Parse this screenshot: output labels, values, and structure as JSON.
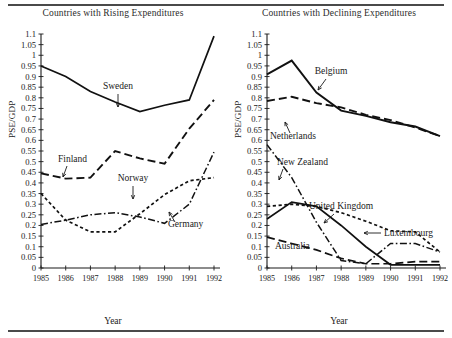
{
  "figure": {
    "ylabel": "PSE/GDP",
    "xlabel": "Year",
    "years": [
      1985,
      1986,
      1987,
      1988,
      1989,
      1990,
      1991,
      1992
    ],
    "ytick_labels": [
      "0",
      "0.05",
      "0.1",
      "0.15",
      "0.2",
      "0.25",
      "0.3",
      "0.35",
      "0.4",
      "0.45",
      "0.5",
      "0.55",
      "0.6",
      "0.65",
      "0.7",
      "0.75",
      "0.8",
      "0.85",
      "0.9",
      "0.95",
      "1",
      "1.05",
      "1.1"
    ],
    "ytick_values": [
      0,
      0.05,
      0.1,
      0.15,
      0.2,
      0.25,
      0.3,
      0.35,
      0.4,
      0.45,
      0.5,
      0.55,
      0.6,
      0.65,
      0.7,
      0.75,
      0.8,
      0.85,
      0.9,
      0.95,
      1.0,
      1.05,
      1.1
    ],
    "ylim": [
      0,
      1.1
    ],
    "xlim": [
      1985,
      1992
    ],
    "line_color": "#111111"
  },
  "chart_data": [
    {
      "type": "line",
      "title": "Countries with Rising Expenditures",
      "xlabel": "Year",
      "ylabel": "PSE/GDP",
      "x": [
        1985,
        1986,
        1987,
        1988,
        1989,
        1990,
        1991,
        1992
      ],
      "xlim": [
        1985,
        1992
      ],
      "ylim": [
        0,
        1.1
      ],
      "grid": false,
      "legend": "inline-annotations",
      "series": [
        {
          "name": "Sweden",
          "style": "solid",
          "values": [
            0.95,
            0.9,
            0.83,
            0.78,
            0.735,
            0.765,
            0.79,
            1.09
          ]
        },
        {
          "name": "Finland",
          "style": "long-dash",
          "values": [
            0.445,
            0.42,
            0.425,
            0.55,
            0.515,
            0.49,
            0.655,
            0.79
          ]
        },
        {
          "name": "Norway",
          "style": "short-dash",
          "values": [
            0.35,
            0.225,
            0.17,
            0.17,
            0.255,
            0.345,
            0.41,
            0.425
          ]
        },
        {
          "name": "Germany",
          "style": "dash-dot",
          "values": [
            0.205,
            0.225,
            0.25,
            0.26,
            0.24,
            0.21,
            0.3,
            0.545
          ]
        }
      ],
      "annotations": [
        {
          "label": "Sweden",
          "points_to": "Sweden"
        },
        {
          "label": "Finland",
          "points_to": "Finland"
        },
        {
          "label": "Norway",
          "points_to": "Norway"
        },
        {
          "label": "Germany",
          "points_to": "Germany"
        }
      ]
    },
    {
      "type": "line",
      "title": "Countries with Declining Expenditures",
      "xlabel": "Year",
      "ylabel": "PSE/GDP",
      "x": [
        1985,
        1986,
        1987,
        1988,
        1989,
        1990,
        1991,
        1992
      ],
      "xlim": [
        1985,
        1992
      ],
      "ylim": [
        0,
        1.1
      ],
      "grid": false,
      "legend": "inline-annotations",
      "series": [
        {
          "name": "Belgium",
          "style": "solid-thick",
          "values": [
            0.91,
            0.975,
            0.825,
            0.74,
            0.715,
            0.685,
            0.665,
            0.62
          ]
        },
        {
          "name": "Netherlands",
          "style": "long-dash",
          "values": [
            0.785,
            0.805,
            0.775,
            0.755,
            0.72,
            0.695,
            0.66,
            0.62
          ]
        },
        {
          "name": "New Zealand",
          "style": "dash-dot",
          "values": [
            0.58,
            0.425,
            0.215,
            0.035,
            0.02,
            0.115,
            0.115,
            0.075
          ]
        },
        {
          "name": "United Kingdom",
          "style": "solid",
          "values": [
            0.23,
            0.31,
            0.29,
            0.2,
            0.1,
            0.015,
            0.015,
            0.015
          ]
        },
        {
          "name": "Luxembourg",
          "style": "short-dash",
          "values": [
            0.29,
            0.3,
            0.29,
            0.26,
            0.22,
            0.175,
            0.17,
            0.075
          ]
        },
        {
          "name": "Australia",
          "style": "long-dash-low",
          "values": [
            0.145,
            0.115,
            0.085,
            0.045,
            0.02,
            0.02,
            0.03,
            0.03
          ]
        }
      ],
      "annotations": [
        {
          "label": "Belgium",
          "points_to": "Belgium"
        },
        {
          "label": "Netherlands",
          "points_to": "Netherlands"
        },
        {
          "label": "New Zealand",
          "points_to": "New Zealand"
        },
        {
          "label": "United Kingdom",
          "points_to": "United Kingdom"
        },
        {
          "label": "Luxembourg",
          "points_to": "Luxembourg"
        },
        {
          "label": "Australia",
          "points_to": "Australia"
        }
      ]
    }
  ]
}
